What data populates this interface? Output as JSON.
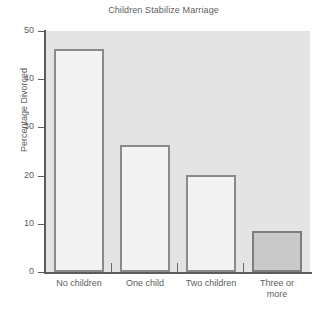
{
  "chart_data": {
    "type": "bar",
    "title": "Children Stabilize Marriage",
    "xlabel": "",
    "ylabel": "Percentage Divorced",
    "categories": [
      "No children",
      "One child",
      "Two children",
      "Three or more"
    ],
    "values": [
      46.3,
      26.3,
      20.2,
      8.5
    ],
    "ylim": [
      0,
      50
    ],
    "yticks": [
      0,
      10,
      20,
      30,
      40,
      50
    ],
    "ytick_labels": [
      "0",
      "10",
      "20",
      "30",
      "40",
      "50"
    ],
    "grid": false,
    "legend": null,
    "series": [
      {
        "name": "Percentage Divorced",
        "values": [
          46.3,
          26.3,
          20.2,
          8.5
        ]
      }
    ],
    "bar_styles": [
      {
        "fill": "#f3f3f3",
        "edge": "#8a8a8a",
        "filled": false
      },
      {
        "fill": "#f3f3f3",
        "edge": "#8a8a8a",
        "filled": false
      },
      {
        "fill": "#f3f3f3",
        "edge": "#8a8a8a",
        "filled": false
      },
      {
        "fill": "#c9c9c9",
        "edge": "#7e7e7e",
        "filled": true
      }
    ],
    "colors": {
      "plot_background": "#e4e4e4",
      "figure_background": "#ffffff",
      "axis": "#5b5b5b",
      "text": "#5e5e5e",
      "bar_open_fill": "#f3f3f3",
      "bar_open_edge": "#8a8a8a",
      "bar_solid_fill": "#c9c9c9",
      "bar_solid_edge": "#7e7e7e"
    }
  },
  "category_lines": [
    [
      "No children"
    ],
    [
      "One child"
    ],
    [
      "Two children"
    ],
    [
      "Three or",
      "more"
    ]
  ]
}
